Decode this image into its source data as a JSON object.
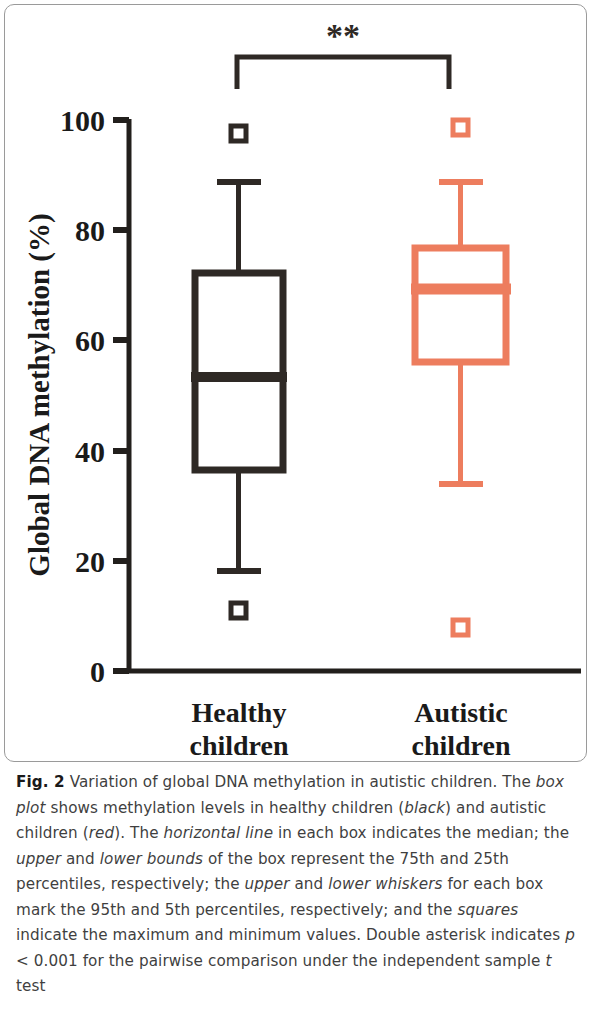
{
  "figure": {
    "label": "Fig. 2",
    "caption_segments": [
      {
        "text": "Variation of global DNA methylation in autistic children. The ",
        "style": "normal"
      },
      {
        "text": "box plot",
        "style": "italic"
      },
      {
        "text": " shows methylation levels in healthy children (",
        "style": "normal"
      },
      {
        "text": "black",
        "style": "italic"
      },
      {
        "text": ") and autistic children (",
        "style": "normal"
      },
      {
        "text": "red",
        "style": "italic"
      },
      {
        "text": "). The ",
        "style": "normal"
      },
      {
        "text": "horizontal line",
        "style": "italic"
      },
      {
        "text": " in each box indicates the median; the ",
        "style": "normal"
      },
      {
        "text": "upper",
        "style": "italic"
      },
      {
        "text": " and ",
        "style": "normal"
      },
      {
        "text": "lower bounds",
        "style": "italic"
      },
      {
        "text": " of the box represent the 75th and 25th percentiles, respectively; the ",
        "style": "normal"
      },
      {
        "text": "upper",
        "style": "italic"
      },
      {
        "text": " and ",
        "style": "normal"
      },
      {
        "text": "lower whiskers",
        "style": "italic"
      },
      {
        "text": " for each box mark the 95th and 5th percentiles, respectively; and the ",
        "style": "normal"
      },
      {
        "text": "squares",
        "style": "italic"
      },
      {
        "text": " indicate the maximum and minimum values. Double asterisk indicates ",
        "style": "normal"
      },
      {
        "text": "p",
        "style": "italic"
      },
      {
        "text": " < 0.001 for the pairwise comparison under the independent sample ",
        "style": "normal"
      },
      {
        "text": "t",
        "style": "italic"
      },
      {
        "text": " test",
        "style": "normal"
      }
    ],
    "caption_plain": "Fig. 2 Variation of global DNA methylation in autistic children. The box plot shows methylation levels in healthy children (black) and autistic children (red). The horizontal line in each box indicates the median; the upper and lower bounds of the box represent the 75th and 25th percentiles, respectively; the upper and lower whiskers for each box mark the 95th and 5th percentiles, respectively; and the squares indicate the maximum and minimum values. Double asterisk indicates p < 0.001 for the pairwise comparison under the independent sample t test"
  },
  "chart_data": {
    "type": "box",
    "title": "",
    "xlabel": "",
    "ylabel": "Global DNA methylation (%)",
    "ylim": [
      0,
      100
    ],
    "yticks": [
      0,
      20,
      40,
      60,
      80,
      100
    ],
    "ytick_labels": [
      "0",
      "20",
      "40",
      "60",
      "80",
      "100"
    ],
    "grid": false,
    "legend": "none",
    "categories": [
      "Healthy children",
      "Autistic children"
    ],
    "category_lines": [
      [
        "Healthy",
        "children"
      ],
      [
        "Autistic",
        "children"
      ]
    ],
    "series": [
      {
        "name": "Healthy children",
        "color": "#2e2925",
        "max": 97,
        "whisker_high": 89,
        "q3": 72,
        "median": 54,
        "q1": 37,
        "whisker_low": 19,
        "min": 12
      },
      {
        "name": "Autistic children",
        "color": "#ed7d5e",
        "max": 98,
        "whisker_high": 89,
        "q3": 77,
        "median": 69.5,
        "q1": 56,
        "whisker_low": 34.5,
        "min": 8.7
      }
    ],
    "annotations": [
      {
        "kind": "significance-bracket",
        "label": "**",
        "from": "Healthy children",
        "to": "Autistic children",
        "p_value": "p < 0.001"
      }
    ]
  },
  "colors": {
    "black_group": "#2e2925",
    "red_group": "#ed7d5e",
    "axis": "#221f1c",
    "panel_border": "#9a9a9a",
    "caption_text": "#3f3f3f"
  }
}
